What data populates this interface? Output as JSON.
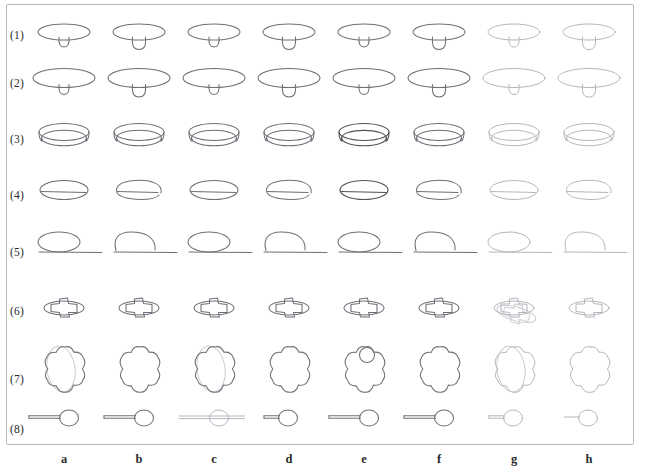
{
  "figure": {
    "kind": "shape-grid-plate",
    "caption_present": false,
    "background_color": "#ffffff",
    "frame_color": "#b9b9b9",
    "stroke_color": "#6f6f77",
    "stroke_color_dark": "#53535b",
    "stroke_color_faint": "#b6b6be",
    "grid": {
      "rows": 8,
      "cols": 8
    },
    "row_labels": [
      "(1)",
      "(2)",
      "(3)",
      "(4)",
      "(5)",
      "(6)",
      "(7)",
      "(8)"
    ],
    "col_labels": [
      "a",
      "b",
      "c",
      "d",
      "e",
      "f",
      "g",
      "h"
    ],
    "row_shape_names": [
      "small-capped-table",
      "large-capped-table",
      "open-bowl-ring",
      "ellipse-with-chord",
      "ellipse-on-ground-line",
      "cross-through-disc",
      "cloud-blob-with-ellipse",
      "spoon-with-handle"
    ]
  },
  "chart_data": {
    "type": "table",
    "title": "",
    "xlabel": "",
    "ylabel": "",
    "categories": [
      "a",
      "b",
      "c",
      "d",
      "e",
      "f",
      "g",
      "h"
    ],
    "row_labels": [
      "(1)",
      "(2)",
      "(3)",
      "(4)",
      "(5)",
      "(6)",
      "(7)",
      "(8)"
    ],
    "cells": [
      {
        "row": "(1)",
        "shape": "small-capped-table",
        "variants": [
          {
            "col": "a",
            "tone": "normal",
            "stem": "small",
            "extra": "none"
          },
          {
            "col": "b",
            "tone": "normal",
            "stem": "medium",
            "extra": "none"
          },
          {
            "col": "c",
            "tone": "normal",
            "stem": "small",
            "extra": "none"
          },
          {
            "col": "d",
            "tone": "normal",
            "stem": "medium",
            "extra": "none"
          },
          {
            "col": "e",
            "tone": "normal",
            "stem": "small",
            "extra": "none"
          },
          {
            "col": "f",
            "tone": "normal",
            "stem": "medium",
            "extra": "none"
          },
          {
            "col": "g",
            "tone": "faint",
            "stem": "small",
            "extra": "none"
          },
          {
            "col": "h",
            "tone": "faint",
            "stem": "medium",
            "extra": "none"
          }
        ]
      },
      {
        "row": "(2)",
        "shape": "large-capped-table",
        "variants": [
          {
            "col": "a",
            "tone": "normal",
            "stem": "small",
            "extra": "none"
          },
          {
            "col": "b",
            "tone": "normal",
            "stem": "medium",
            "extra": "none"
          },
          {
            "col": "c",
            "tone": "normal",
            "stem": "small",
            "extra": "none"
          },
          {
            "col": "d",
            "tone": "normal",
            "stem": "medium",
            "extra": "none"
          },
          {
            "col": "e",
            "tone": "normal",
            "stem": "small",
            "extra": "none"
          },
          {
            "col": "f",
            "tone": "normal",
            "stem": "medium",
            "extra": "none"
          },
          {
            "col": "g",
            "tone": "faint",
            "stem": "small",
            "extra": "none"
          },
          {
            "col": "h",
            "tone": "faint",
            "stem": "medium",
            "extra": "none"
          }
        ]
      },
      {
        "row": "(3)",
        "shape": "open-bowl-ring",
        "variants": [
          {
            "col": "a",
            "tone": "normal",
            "stem": "none",
            "extra": "inner-ellipse"
          },
          {
            "col": "b",
            "tone": "normal",
            "stem": "none",
            "extra": "inner-ellipse"
          },
          {
            "col": "c",
            "tone": "normal",
            "stem": "none",
            "extra": "inner-ellipse"
          },
          {
            "col": "d",
            "tone": "normal",
            "stem": "none",
            "extra": "inner-ellipse"
          },
          {
            "col": "e",
            "tone": "dark",
            "stem": "none",
            "extra": "inner-ellipse"
          },
          {
            "col": "f",
            "tone": "normal",
            "stem": "none",
            "extra": "inner-ellipse"
          },
          {
            "col": "g",
            "tone": "faint",
            "stem": "none",
            "extra": "inner-ellipse"
          },
          {
            "col": "h",
            "tone": "faint",
            "stem": "none",
            "extra": "inner-ellipse"
          }
        ]
      },
      {
        "row": "(4)",
        "shape": "ellipse-with-chord",
        "variants": [
          {
            "col": "a",
            "tone": "normal",
            "stem": "none",
            "extra": "closed-ellipse"
          },
          {
            "col": "b",
            "tone": "normal",
            "stem": "none",
            "extra": "open-hook"
          },
          {
            "col": "c",
            "tone": "normal",
            "stem": "none",
            "extra": "closed-ellipse"
          },
          {
            "col": "d",
            "tone": "normal",
            "stem": "none",
            "extra": "open-hook"
          },
          {
            "col": "e",
            "tone": "dark",
            "stem": "none",
            "extra": "closed-ellipse"
          },
          {
            "col": "f",
            "tone": "normal",
            "stem": "none",
            "extra": "open-hook"
          },
          {
            "col": "g",
            "tone": "faint",
            "stem": "none",
            "extra": "closed-ellipse"
          },
          {
            "col": "h",
            "tone": "faint",
            "stem": "none",
            "extra": "open-hook"
          }
        ]
      },
      {
        "row": "(5)",
        "shape": "ellipse-on-ground-line",
        "variants": [
          {
            "col": "a",
            "tone": "normal",
            "stem": "none",
            "extra": "closed-ellipse"
          },
          {
            "col": "b",
            "tone": "normal",
            "stem": "none",
            "extra": "open-hook"
          },
          {
            "col": "c",
            "tone": "normal",
            "stem": "none",
            "extra": "closed-ellipse"
          },
          {
            "col": "d",
            "tone": "normal",
            "stem": "none",
            "extra": "open-hook"
          },
          {
            "col": "e",
            "tone": "normal",
            "stem": "none",
            "extra": "closed-ellipse"
          },
          {
            "col": "f",
            "tone": "normal",
            "stem": "none",
            "extra": "open-hook"
          },
          {
            "col": "g",
            "tone": "faint",
            "stem": "none",
            "extra": "closed-ellipse"
          },
          {
            "col": "h",
            "tone": "faint",
            "stem": "none",
            "extra": "open-hook"
          }
        ]
      },
      {
        "row": "(6)",
        "shape": "cross-through-disc",
        "variants": [
          {
            "col": "a",
            "tone": "normal",
            "stem": "none",
            "extra": "with-disc"
          },
          {
            "col": "b",
            "tone": "normal",
            "stem": "none",
            "extra": "with-disc"
          },
          {
            "col": "c",
            "tone": "normal",
            "stem": "none",
            "extra": "with-disc"
          },
          {
            "col": "d",
            "tone": "normal",
            "stem": "none",
            "extra": "with-disc"
          },
          {
            "col": "e",
            "tone": "normal",
            "stem": "none",
            "extra": "with-disc"
          },
          {
            "col": "f",
            "tone": "normal",
            "stem": "none",
            "extra": "with-disc"
          },
          {
            "col": "g",
            "tone": "faint",
            "stem": "none",
            "extra": "rotated-ghost-duplicate"
          },
          {
            "col": "h",
            "tone": "faint",
            "stem": "none",
            "extra": "with-disc"
          }
        ]
      },
      {
        "row": "(7)",
        "shape": "cloud-blob-with-ellipse",
        "variants": [
          {
            "col": "a",
            "tone": "normal",
            "stem": "none",
            "extra": "overlaid-ellipse"
          },
          {
            "col": "b",
            "tone": "normal",
            "stem": "none",
            "extra": "none"
          },
          {
            "col": "c",
            "tone": "normal",
            "stem": "none",
            "extra": "overlaid-ellipse"
          },
          {
            "col": "d",
            "tone": "normal",
            "stem": "none",
            "extra": "none"
          },
          {
            "col": "e",
            "tone": "normal",
            "stem": "none",
            "extra": "small-circle"
          },
          {
            "col": "f",
            "tone": "normal",
            "stem": "none",
            "extra": "none"
          },
          {
            "col": "g",
            "tone": "faint",
            "stem": "none",
            "extra": "overlaid-ellipse"
          },
          {
            "col": "h",
            "tone": "faint",
            "stem": "none",
            "extra": "none"
          }
        ]
      },
      {
        "row": "(8)",
        "shape": "spoon-with-handle",
        "variants": [
          {
            "col": "a",
            "tone": "normal",
            "stem": "long",
            "extra": "double-rail"
          },
          {
            "col": "b",
            "tone": "normal",
            "stem": "long",
            "extra": "double-rail"
          },
          {
            "col": "c",
            "tone": "faint",
            "stem": "long",
            "extra": "through-rail"
          },
          {
            "col": "d",
            "tone": "normal",
            "stem": "short",
            "extra": "double-rail"
          },
          {
            "col": "e",
            "tone": "normal",
            "stem": "long",
            "extra": "double-rail"
          },
          {
            "col": "f",
            "tone": "normal",
            "stem": "long",
            "extra": "double-rail"
          },
          {
            "col": "g",
            "tone": "faint",
            "stem": "short",
            "extra": "double-rail"
          },
          {
            "col": "h",
            "tone": "faint",
            "stem": "short",
            "extra": "single-rail"
          }
        ]
      }
    ]
  }
}
